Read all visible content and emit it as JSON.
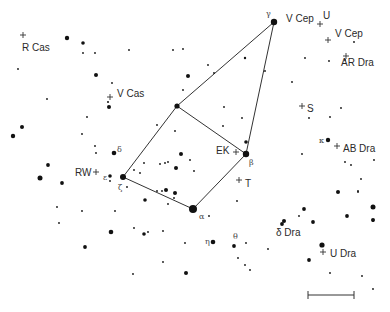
{
  "chart_title": "Cepheus finder chart",
  "colors": {
    "ink": "#111111",
    "label": "#2a2a2a",
    "line": "#333333",
    "background": "#ffffff"
  },
  "asterism": {
    "name": "Cepheus",
    "vertices": [
      {
        "id": "gamma",
        "x": 274,
        "y": 22
      },
      {
        "id": "iota",
        "x": 177,
        "y": 106
      },
      {
        "id": "zeta",
        "x": 123,
        "y": 177
      },
      {
        "id": "alpha",
        "x": 193,
        "y": 209
      },
      {
        "id": "beta",
        "x": 246,
        "y": 154
      }
    ],
    "edges": [
      [
        "gamma",
        "iota"
      ],
      [
        "iota",
        "zeta"
      ],
      [
        "zeta",
        "alpha"
      ],
      [
        "alpha",
        "beta"
      ],
      [
        "beta",
        "gamma"
      ],
      [
        "iota",
        "beta"
      ]
    ]
  },
  "greek_labels": [
    {
      "text": "γ",
      "x": 266,
      "y": 16
    },
    {
      "text": "δ",
      "x": 117,
      "y": 152
    },
    {
      "text": "ε",
      "x": 103,
      "y": 180
    },
    {
      "text": "ζ",
      "x": 118,
      "y": 190
    },
    {
      "text": "α",
      "x": 199,
      "y": 219
    },
    {
      "text": "β",
      "x": 249,
      "y": 165
    },
    {
      "text": "κ",
      "x": 319,
      "y": 143
    },
    {
      "text": "η",
      "x": 205,
      "y": 244
    },
    {
      "text": "θ",
      "x": 233,
      "y": 239
    }
  ],
  "variable_stars": [
    {
      "name": "R Cas",
      "cross_x": 23,
      "cross_y": 35,
      "label_x": 22,
      "label_y": 51
    },
    {
      "name": "V Cas",
      "cross_x": 110,
      "cross_y": 97,
      "label_x": 117,
      "label_y": 97
    },
    {
      "name": "V Cep",
      "cross_x": 0,
      "cross_y": 0,
      "label_x": 286,
      "label_y": 22
    },
    {
      "name": "U",
      "cross_x": 320,
      "cross_y": 24,
      "label_x": 323,
      "label_y": 19
    },
    {
      "name": "V Cep",
      "cross_x": 328,
      "cross_y": 40,
      "label_x": 335,
      "label_y": 37
    },
    {
      "name": "AR Dra",
      "cross_x": 346,
      "cross_y": 56,
      "label_x": 341,
      "label_y": 66
    },
    {
      "name": "S",
      "cross_x": 302,
      "cross_y": 106,
      "label_x": 307,
      "label_y": 112
    },
    {
      "name": "AB Dra",
      "cross_x": 337,
      "cross_y": 146,
      "label_x": 343,
      "label_y": 152
    },
    {
      "name": "EK",
      "cross_x": 236,
      "cross_y": 152,
      "label_x": 216,
      "label_y": 154
    },
    {
      "name": "T",
      "cross_x": 239,
      "cross_y": 180,
      "label_x": 245,
      "label_y": 187
    },
    {
      "name": "RW",
      "cross_x": 96,
      "cross_y": 172,
      "label_x": 75,
      "label_y": 176
    },
    {
      "name": "δ Dra",
      "cross_x": 0,
      "cross_y": 0,
      "label_x": 276,
      "label_y": 236
    },
    {
      "name": "U Dra",
      "cross_x": 323,
      "cross_y": 252,
      "label_x": 330,
      "label_y": 257
    }
  ],
  "stars": [
    {
      "x": 67,
      "y": 38,
      "r": 2.2
    },
    {
      "x": 83,
      "y": 43,
      "r": 1.8
    },
    {
      "x": 83,
      "y": 53,
      "r": 0.9
    },
    {
      "x": 95,
      "y": 53,
      "r": 0.9
    },
    {
      "x": 129,
      "y": 50,
      "r": 0.9
    },
    {
      "x": 173,
      "y": 50,
      "r": 0.9
    },
    {
      "x": 183,
      "y": 49,
      "r": 0.9
    },
    {
      "x": 18,
      "y": 69,
      "r": 0.9
    },
    {
      "x": 96,
      "y": 75,
      "r": 2.0
    },
    {
      "x": 112,
      "y": 83,
      "r": 0.9
    },
    {
      "x": 208,
      "y": 65,
      "r": 0.9
    },
    {
      "x": 214,
      "y": 73,
      "r": 0.9
    },
    {
      "x": 188,
      "y": 76,
      "r": 2.0
    },
    {
      "x": 183,
      "y": 90,
      "r": 0.9
    },
    {
      "x": 245,
      "y": 58,
      "r": 1.2
    },
    {
      "x": 265,
      "y": 71,
      "r": 0.9
    },
    {
      "x": 292,
      "y": 82,
      "r": 0.9
    },
    {
      "x": 354,
      "y": 42,
      "r": 0.9
    },
    {
      "x": 329,
      "y": 61,
      "r": 0.9
    },
    {
      "x": 345,
      "y": 60,
      "r": 0.9
    },
    {
      "x": 47,
      "y": 99,
      "r": 0.9
    },
    {
      "x": 108,
      "y": 102,
      "r": 1.0
    },
    {
      "x": 109,
      "y": 107,
      "r": 2.0
    },
    {
      "x": 22,
      "y": 127,
      "r": 2.0
    },
    {
      "x": 13,
      "y": 136,
      "r": 2.2
    },
    {
      "x": 48,
      "y": 165,
      "r": 1.9
    },
    {
      "x": 40,
      "y": 178,
      "r": 2.5
    },
    {
      "x": 62,
      "y": 183,
      "r": 1.9
    },
    {
      "x": 57,
      "y": 207,
      "r": 0.9
    },
    {
      "x": 87,
      "y": 117,
      "r": 0.9
    },
    {
      "x": 82,
      "y": 134,
      "r": 0.9
    },
    {
      "x": 95,
      "y": 146,
      "r": 0.9
    },
    {
      "x": 96,
      "y": 153,
      "r": 0.9
    },
    {
      "x": 114,
      "y": 153,
      "r": 2.3
    },
    {
      "x": 110,
      "y": 176,
      "r": 1.8
    },
    {
      "x": 110,
      "y": 181,
      "r": 0.9
    },
    {
      "x": 127,
      "y": 187,
      "r": 0.9
    },
    {
      "x": 157,
      "y": 125,
      "r": 0.9
    },
    {
      "x": 175,
      "y": 131,
      "r": 0.9
    },
    {
      "x": 144,
      "y": 163,
      "r": 0.9
    },
    {
      "x": 134,
      "y": 170,
      "r": 0.9
    },
    {
      "x": 181,
      "y": 154,
      "r": 2.0
    },
    {
      "x": 190,
      "y": 160,
      "r": 0.9
    },
    {
      "x": 160,
      "y": 164,
      "r": 0.9
    },
    {
      "x": 165,
      "y": 163,
      "r": 0.9
    },
    {
      "x": 168,
      "y": 162,
      "r": 0.9
    },
    {
      "x": 176,
      "y": 168,
      "r": 2.0
    },
    {
      "x": 140,
      "y": 173,
      "r": 0.9
    },
    {
      "x": 194,
      "y": 171,
      "r": 0.9
    },
    {
      "x": 157,
      "y": 191,
      "r": 0.9
    },
    {
      "x": 162,
      "y": 191,
      "r": 0.9
    },
    {
      "x": 166,
      "y": 190,
      "r": 2.0
    },
    {
      "x": 175,
      "y": 193,
      "r": 2.0
    },
    {
      "x": 145,
      "y": 200,
      "r": 1.8
    },
    {
      "x": 174,
      "y": 198,
      "r": 0.9
    },
    {
      "x": 144,
      "y": 234,
      "r": 1.8
    },
    {
      "x": 134,
      "y": 228,
      "r": 0.9
    },
    {
      "x": 168,
      "y": 204,
      "r": 0.9
    },
    {
      "x": 209,
      "y": 216,
      "r": 0.9
    },
    {
      "x": 237,
      "y": 201,
      "r": 0.9
    },
    {
      "x": 223,
      "y": 126,
      "r": 0.9
    },
    {
      "x": 224,
      "y": 107,
      "r": 0.9
    },
    {
      "x": 242,
      "y": 118,
      "r": 0.9
    },
    {
      "x": 246,
      "y": 142,
      "r": 1.8
    },
    {
      "x": 148,
      "y": 232,
      "r": 0.9
    },
    {
      "x": 163,
      "y": 231,
      "r": 0.9
    },
    {
      "x": 185,
      "y": 243,
      "r": 0.9
    },
    {
      "x": 213,
      "y": 242,
      "r": 2.3
    },
    {
      "x": 234,
      "y": 246,
      "r": 1.9
    },
    {
      "x": 246,
      "y": 243,
      "r": 0.9
    },
    {
      "x": 238,
      "y": 258,
      "r": 0.9
    },
    {
      "x": 245,
      "y": 265,
      "r": 0.9
    },
    {
      "x": 250,
      "y": 270,
      "r": 0.9
    },
    {
      "x": 163,
      "y": 262,
      "r": 0.9
    },
    {
      "x": 186,
      "y": 273,
      "r": 2.0
    },
    {
      "x": 133,
      "y": 274,
      "r": 0.9
    },
    {
      "x": 59,
      "y": 223,
      "r": 0.9
    },
    {
      "x": 85,
      "y": 247,
      "r": 1.9
    },
    {
      "x": 111,
      "y": 232,
      "r": 2.3
    },
    {
      "x": 82,
      "y": 211,
      "r": 0.9
    },
    {
      "x": 115,
      "y": 211,
      "r": 0.9
    },
    {
      "x": 305,
      "y": 58,
      "r": 0.9
    },
    {
      "x": 330,
      "y": 117,
      "r": 0.9
    },
    {
      "x": 341,
      "y": 108,
      "r": 0.9
    },
    {
      "x": 309,
      "y": 118,
      "r": 0.9
    },
    {
      "x": 328,
      "y": 140,
      "r": 2.2
    },
    {
      "x": 302,
      "y": 154,
      "r": 0.9
    },
    {
      "x": 345,
      "y": 162,
      "r": 0.9
    },
    {
      "x": 351,
      "y": 165,
      "r": 0.9
    },
    {
      "x": 374,
      "y": 160,
      "r": 0.9
    },
    {
      "x": 361,
      "y": 179,
      "r": 0.9
    },
    {
      "x": 358,
      "y": 191,
      "r": 0.9
    },
    {
      "x": 338,
      "y": 192,
      "r": 2.0
    },
    {
      "x": 358,
      "y": 192,
      "r": 0.9
    },
    {
      "x": 373,
      "y": 207,
      "r": 2.5
    },
    {
      "x": 373,
      "y": 220,
      "r": 2.0
    },
    {
      "x": 304,
      "y": 209,
      "r": 1.9
    },
    {
      "x": 299,
      "y": 216,
      "r": 0.9
    },
    {
      "x": 284,
      "y": 221,
      "r": 2.0
    },
    {
      "x": 347,
      "y": 216,
      "r": 1.9
    },
    {
      "x": 373,
      "y": 221,
      "r": 0.9
    },
    {
      "x": 282,
      "y": 224,
      "r": 1.9
    },
    {
      "x": 268,
      "y": 249,
      "r": 0.9
    },
    {
      "x": 313,
      "y": 222,
      "r": 1.9
    },
    {
      "x": 322,
      "y": 245,
      "r": 2.6
    },
    {
      "x": 309,
      "y": 260,
      "r": 1.9
    },
    {
      "x": 330,
      "y": 273,
      "r": 0.9
    },
    {
      "x": 362,
      "y": 276,
      "r": 0.9
    },
    {
      "x": 373,
      "y": 289,
      "r": 0.9
    }
  ],
  "scale_bar": {
    "x1": 308,
    "x2": 354,
    "y": 295,
    "tick": 4
  }
}
